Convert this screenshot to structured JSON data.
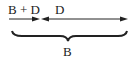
{
  "diagram": {
    "label_left": "B + D",
    "label_right": "D",
    "label_total": "B",
    "stroke_color": "#222222"
  }
}
